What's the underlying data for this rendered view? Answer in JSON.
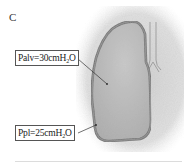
{
  "panel": {
    "letter": "C"
  },
  "labels": {
    "palv": {
      "prefix": "Palv=30cmH",
      "sub": "2",
      "suffix": "O"
    },
    "ppl": {
      "prefix": "Ppl=25cmH",
      "sub": "2",
      "suffix": "O"
    }
  },
  "colors": {
    "background_shade": "#d9d9d9",
    "lung_fill": "#b8b8b8",
    "lung_outline": "#6a6a6a",
    "lung_outline_inner": "#9a9a9a",
    "box_border": "#555555",
    "text": "#222222"
  }
}
